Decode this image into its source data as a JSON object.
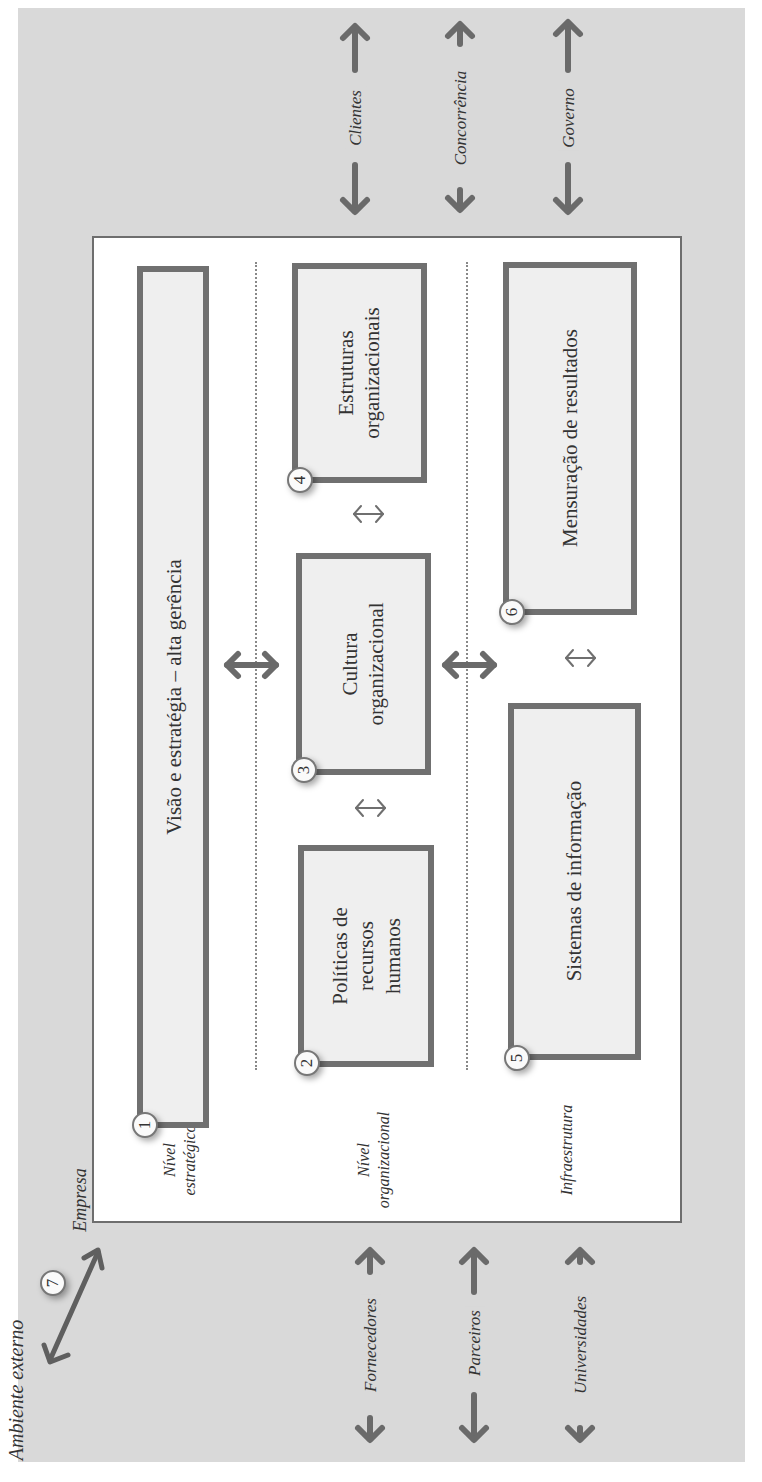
{
  "diagram": {
    "orientation": "rotated 90° counter-clockwise",
    "outer_label": "Ambiente externo",
    "company_label": "Empresa",
    "external_marker": "7",
    "levels": [
      {
        "line1": "Nível",
        "line2": "estratégico"
      },
      {
        "line1": "Nível",
        "line2": "organizacional"
      },
      {
        "line1": "Infraestrutura",
        "line2": ""
      }
    ],
    "boxes": [
      {
        "number": "1",
        "lines": [
          "Visão e estratégia – alta gerência"
        ]
      },
      {
        "number": "2",
        "lines": [
          "Políticas de",
          "recursos",
          "humanos"
        ]
      },
      {
        "number": "3",
        "lines": [
          "Cultura",
          "organizacional"
        ]
      },
      {
        "number": "4",
        "lines": [
          "Estruturas",
          "organizacionais"
        ]
      },
      {
        "number": "5",
        "lines": [
          "Sistemas de informação"
        ]
      },
      {
        "number": "6",
        "lines": [
          "Mensuração de resultados"
        ]
      }
    ],
    "external_actors_top": [
      "Clientes",
      "Concorrência",
      "Governo"
    ],
    "external_actors_bottom": [
      "Fornecedores",
      "Parceiros",
      "Universidades"
    ],
    "colors": {
      "background": "#d9d9d9",
      "box_fill": "#efefef",
      "box_border": "#707070",
      "arrow": "#6a6a6a",
      "company_fill": "#ffffff"
    }
  }
}
